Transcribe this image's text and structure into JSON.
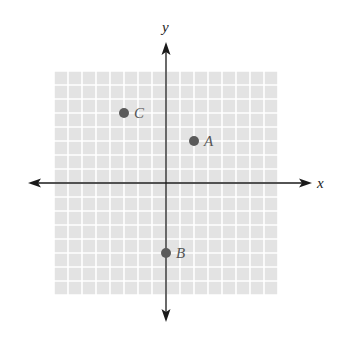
{
  "chart_data": {
    "type": "scatter",
    "title": "",
    "xlabel": "x",
    "ylabel": "y",
    "xlim": [
      -8,
      8
    ],
    "ylim": [
      -8,
      8
    ],
    "grid": true,
    "tick_labels": false,
    "points": [
      {
        "label": "A",
        "x": 2,
        "y": 3
      },
      {
        "label": "B",
        "x": 0,
        "y": -5
      },
      {
        "label": "C",
        "x": -3,
        "y": 5
      }
    ]
  },
  "colors": {
    "grid_fill": "#e3e3e3",
    "grid_line": "#ffffff",
    "axis": "#1a1a1a",
    "point": "#5a5a5a",
    "point_label": "#555555"
  },
  "layout": {
    "origin_x": 166,
    "origin_y": 183,
    "cell": 14,
    "cells_each_side": 8,
    "x_axis_from": 28,
    "x_axis_to": 312,
    "y_axis_from": 42,
    "y_axis_to": 322
  }
}
